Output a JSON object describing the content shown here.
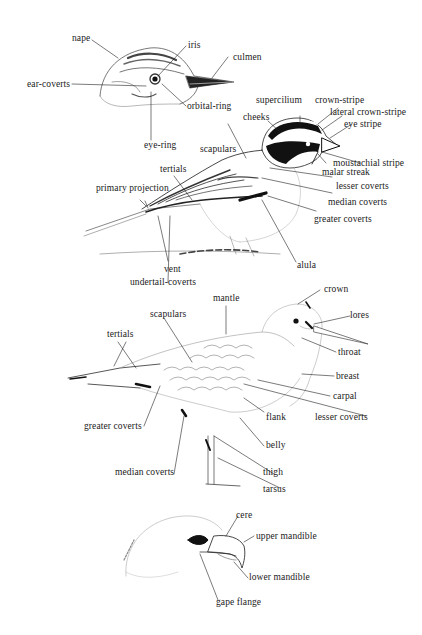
{
  "figure": {
    "title": "",
    "panels": [
      {
        "id": "songbird-head",
        "labels": {
          "nape": "nape",
          "iris": "iris",
          "culmen": "culmen",
          "ear_coverts": "ear-coverts",
          "orbital_ring": "orbital-ring",
          "eye_ring": "eye-ring"
        }
      },
      {
        "id": "sparrow",
        "labels": {
          "supercilium": "supercilium",
          "crown_stripe": "crown-stripe",
          "cheeks": "cheeks",
          "lateral_crown_stripe": "lateral crown-stripe",
          "eye_stripe": "eye stripe",
          "scapulars": "scapulars",
          "tertials": "tertials",
          "moustachial_stripe": "moustachial stripe",
          "malar_streak": "malar streak",
          "primary_projection": "primary projection",
          "lesser_coverts": "lesser coverts",
          "median_coverts": "median coverts",
          "greater_coverts": "greater coverts",
          "alula": "alula",
          "vent": "vent",
          "undertail_coverts": "undertail-coverts"
        }
      },
      {
        "id": "wader",
        "labels": {
          "mantle": "mantle",
          "crown": "crown",
          "lores": "lores",
          "scapulars": "scapulars",
          "tertials": "tertials",
          "throat": "throat",
          "breast": "breast",
          "carpal": "carpal",
          "flank": "flank",
          "lesser_coverts": "lesser coverts",
          "greater_coverts": "greater coverts",
          "belly": "belly",
          "median_coverts": "median coverts",
          "thigh": "thigh",
          "tarsus": "tarsus"
        }
      },
      {
        "id": "raptor-head",
        "labels": {
          "cere": "cere",
          "upper_mandible": "upper mandible",
          "lower_mandible": "lower mandible",
          "gape_flange": "gape flange"
        }
      }
    ]
  }
}
